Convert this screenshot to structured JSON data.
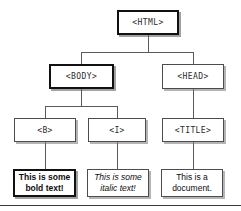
{
  "diagram": {
    "colors": {
      "background": "#ffffff",
      "box_border": "#4c4c4c",
      "box_border_emphasis": "#111111",
      "edge": "#5a5a5a",
      "text": "#111111",
      "rule": "#3a3a3a"
    },
    "nodes": [
      {
        "id": "html",
        "label": "<HTML>",
        "kind": "tag",
        "emphasis": true,
        "x": 117,
        "y": 10,
        "w": 62,
        "h": 25
      },
      {
        "id": "body",
        "label": "<BODY>",
        "kind": "tag",
        "emphasis": true,
        "x": 49,
        "y": 64,
        "h": 25,
        "w": 65
      },
      {
        "id": "head",
        "label": "<HEAD>",
        "kind": "tag",
        "emphasis": false,
        "x": 162,
        "y": 64,
        "w": 62,
        "h": 25
      },
      {
        "id": "b",
        "label": "<B>",
        "kind": "tag",
        "emphasis": false,
        "x": 14,
        "y": 118,
        "w": 62,
        "h": 24
      },
      {
        "id": "i",
        "label": "<I>",
        "kind": "tag",
        "emphasis": false,
        "x": 88,
        "y": 118,
        "w": 58,
        "h": 24
      },
      {
        "id": "title",
        "label": "<TITLE>",
        "kind": "tag",
        "emphasis": false,
        "x": 162,
        "y": 118,
        "w": 62,
        "h": 24
      },
      {
        "id": "bold-text",
        "label": "This is some bold text!",
        "kind": "leaf",
        "style": "bold",
        "emphasis": true,
        "x": 13,
        "y": 169,
        "w": 63,
        "h": 28
      },
      {
        "id": "italic-text",
        "label": "This is some italic text!",
        "kind": "leaf",
        "style": "italic",
        "emphasis": false,
        "x": 87,
        "y": 169,
        "w": 62,
        "h": 28
      },
      {
        "id": "document-text",
        "label": "This is a document.",
        "kind": "leaf",
        "style": "normal",
        "emphasis": false,
        "x": 161,
        "y": 169,
        "w": 62,
        "h": 28
      }
    ],
    "edges": [
      {
        "id": "html-body",
        "from": "html",
        "to": "body"
      },
      {
        "id": "html-head",
        "from": "html",
        "to": "head"
      },
      {
        "id": "body-b",
        "from": "body",
        "to": "b"
      },
      {
        "id": "body-i",
        "from": "body",
        "to": "i"
      },
      {
        "id": "head-title",
        "from": "head",
        "to": "title"
      },
      {
        "id": "b-bold",
        "from": "b",
        "to": "bold-text"
      },
      {
        "id": "i-italic",
        "from": "i",
        "to": "italic-text"
      },
      {
        "id": "title-document",
        "from": "title",
        "to": "document-text"
      }
    ],
    "bottom_rule": {
      "y": 205
    }
  }
}
